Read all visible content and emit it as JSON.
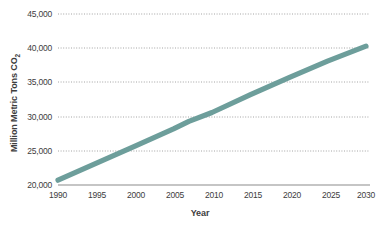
{
  "chart_data": {
    "type": "line",
    "title": "",
    "xlabel": "Year",
    "ylabel": "Million Metric Tons CO2",
    "ylabel_main": "Million Metric Tons CO",
    "ylabel_sub": "2",
    "xlim": [
      1990,
      2030
    ],
    "ylim": [
      20000,
      45000
    ],
    "grid": true,
    "legend": "none",
    "series_color": "#6d9e9b",
    "gridline_color": "#9a9a9a",
    "axis_color": "#8c8c8c",
    "background": "#ffffff",
    "x_ticks": [
      "1990",
      "1995",
      "2000",
      "2005",
      "2010",
      "2015",
      "2020",
      "2025",
      "2030"
    ],
    "y_ticks": [
      "20,000",
      "25,000",
      "30,000",
      "35,000",
      "40,000",
      "45,000"
    ],
    "x": [
      1990,
      1995,
      2000,
      2005,
      2007,
      2010,
      2015,
      2020,
      2025,
      2030
    ],
    "values": [
      20700,
      23200,
      25700,
      28200,
      29300,
      30600,
      33200,
      35700,
      38100,
      40300
    ],
    "series": [
      {
        "name": "CO2 emissions",
        "values": [
          20700,
          23200,
          25700,
          28200,
          29300,
          30600,
          33200,
          35700,
          38100,
          40300
        ]
      }
    ]
  }
}
